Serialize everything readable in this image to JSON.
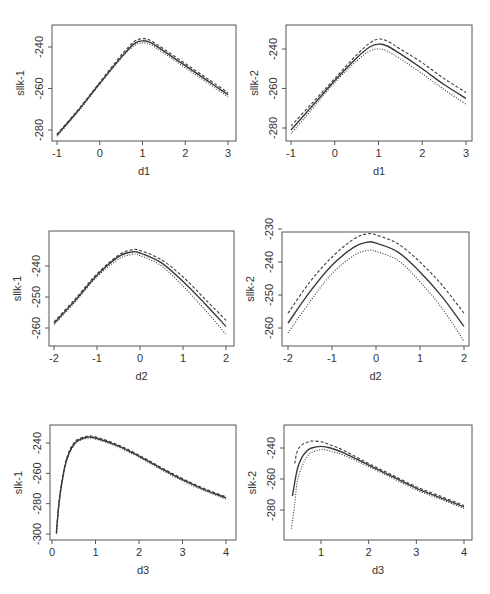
{
  "figure": {
    "layout": "3 rows x 2 columns of profile log-likelihood plots",
    "line_color": "#3a3a3a",
    "box_color": "#555555",
    "text_color": "#333333"
  },
  "chart_data": [
    {
      "id": "p1",
      "type": "line",
      "xlabel": "d1",
      "ylabel": "sllk-1",
      "xlim": [
        -1,
        3
      ],
      "ylim": [
        -284,
        -232
      ],
      "xticks": [
        -1,
        0,
        1,
        2,
        3
      ],
      "yticks": [
        -240,
        -260,
        -280
      ],
      "ytick_labels": [
        "-240",
        "-260",
        "-280"
      ],
      "box": {
        "x0": 52,
        "x1": 236,
        "y0": 25,
        "y1": 141
      },
      "px": {
        "x_at": [
          [
            -1,
            57
          ],
          [
            3,
            228
          ]
        ],
        "y_at": [
          [
            -240,
            47
          ],
          [
            -280,
            130
          ]
        ]
      },
      "series": [
        {
          "name": "upper",
          "style": "dashed",
          "x": [
            -1,
            -0.5,
            0,
            0.5,
            0.8,
            1.0,
            1.2,
            1.5,
            2,
            2.5,
            3
          ],
          "y": [
            -282,
            -270,
            -257,
            -244,
            -237.5,
            -236,
            -237,
            -241,
            -248,
            -255,
            -262
          ]
        },
        {
          "name": "estimate",
          "style": "solid",
          "x": [
            -1,
            -0.5,
            0,
            0.5,
            0.8,
            1.0,
            1.2,
            1.5,
            2,
            2.5,
            3
          ],
          "y": [
            -282.5,
            -270.5,
            -257.5,
            -245,
            -238.5,
            -237,
            -238,
            -242,
            -249,
            -256,
            -263
          ]
        },
        {
          "name": "lower",
          "style": "dotted",
          "x": [
            -1,
            -0.5,
            0,
            0.5,
            0.8,
            1.0,
            1.2,
            1.5,
            2,
            2.5,
            3
          ],
          "y": [
            -283,
            -271,
            -258,
            -245.5,
            -239.5,
            -238,
            -239,
            -243,
            -250,
            -257,
            -264
          ]
        }
      ]
    },
    {
      "id": "p2",
      "type": "line",
      "xlabel": "d1",
      "ylabel": "sllk-2",
      "xlim": [
        -1,
        3
      ],
      "ylim": [
        -284,
        -232
      ],
      "xticks": [
        -1,
        0,
        1,
        2,
        3
      ],
      "yticks": [
        -240,
        -260,
        -280
      ],
      "ytick_labels": [
        "-240",
        "-260",
        "-280"
      ],
      "box": {
        "x0": 286,
        "x1": 472,
        "y0": 25,
        "y1": 141
      },
      "px": {
        "x_at": [
          [
            -1,
            291
          ],
          [
            3,
            466
          ]
        ],
        "y_at": [
          [
            -240,
            49
          ],
          [
            -280,
            128
          ]
        ]
      },
      "series": [
        {
          "name": "upper",
          "style": "dashed",
          "x": [
            -1,
            -0.5,
            0,
            0.5,
            0.8,
            1.0,
            1.2,
            1.5,
            2,
            2.5,
            3
          ],
          "y": [
            -279,
            -267,
            -255,
            -243,
            -237,
            -235,
            -236,
            -240,
            -247,
            -255,
            -262
          ]
        },
        {
          "name": "estimate",
          "style": "solid",
          "x": [
            -1,
            -0.5,
            0,
            0.5,
            0.8,
            1.0,
            1.2,
            1.5,
            2,
            2.5,
            3
          ],
          "y": [
            -281,
            -268.5,
            -256,
            -244.5,
            -239,
            -237.5,
            -238.5,
            -242.5,
            -250,
            -258,
            -265
          ]
        },
        {
          "name": "lower",
          "style": "dotted",
          "x": [
            -1,
            -0.5,
            0,
            0.5,
            0.8,
            1.0,
            1.2,
            1.5,
            2,
            2.5,
            3
          ],
          "y": [
            -283,
            -270,
            -257,
            -246,
            -241,
            -240,
            -241,
            -245,
            -252.5,
            -260.5,
            -268
          ]
        }
      ]
    },
    {
      "id": "p3",
      "type": "line",
      "xlabel": "d2",
      "ylabel": "sllk-1",
      "xlim": [
        -2,
        2
      ],
      "ylim": [
        -261.5,
        -232
      ],
      "xticks": [
        -2,
        -1,
        0,
        1,
        2
      ],
      "yticks": [
        -240,
        -250,
        -260
      ],
      "ytick_labels": [
        "-240",
        "-250",
        "-260"
      ],
      "box": {
        "x0": 49,
        "x1": 234,
        "y0": 231,
        "y1": 346
      },
      "px": {
        "x_at": [
          [
            -2,
            54
          ],
          [
            2,
            226
          ]
        ],
        "y_at": [
          [
            -240,
            266
          ],
          [
            -260,
            328
          ]
        ]
      },
      "series": [
        {
          "name": "upper",
          "style": "dashed",
          "x": [
            -2,
            -1.5,
            -1,
            -0.5,
            -0.2,
            0,
            0.5,
            1,
            1.5,
            2
          ],
          "y": [
            -258,
            -250.5,
            -242.5,
            -236.5,
            -234.8,
            -235,
            -238,
            -243.5,
            -250.5,
            -257.5
          ]
        },
        {
          "name": "estimate",
          "style": "solid",
          "x": [
            -2,
            -1.5,
            -1,
            -0.5,
            -0.2,
            0,
            0.5,
            1,
            1.5,
            2
          ],
          "y": [
            -258.5,
            -251,
            -243,
            -237,
            -235.5,
            -235.8,
            -239,
            -245,
            -252,
            -259.5
          ]
        },
        {
          "name": "lower",
          "style": "dotted",
          "x": [
            -2,
            -1.5,
            -1,
            -0.5,
            -0.2,
            0,
            0.5,
            1,
            1.5,
            2
          ],
          "y": [
            -259,
            -251.5,
            -243.5,
            -237.8,
            -236.3,
            -236.6,
            -240,
            -246.5,
            -254,
            -262
          ]
        }
      ]
    },
    {
      "id": "p4",
      "type": "line",
      "xlabel": "d2",
      "ylabel": "sllk-2",
      "xlim": [
        -2,
        2
      ],
      "ylim": [
        -265,
        -229
      ],
      "xticks": [
        -2,
        -1,
        0,
        1,
        2
      ],
      "yticks": [
        -230,
        -240,
        -250,
        -260
      ],
      "ytick_labels": [
        "-230",
        "-240",
        "-250",
        "-260"
      ],
      "box": {
        "x0": 282,
        "x1": 469,
        "y0": 232,
        "y1": 346
      },
      "px": {
        "x_at": [
          [
            -2,
            288
          ],
          [
            2,
            464
          ]
        ],
        "y_at": [
          [
            -230,
            229
          ],
          [
            -260,
            328
          ]
        ]
      },
      "series": [
        {
          "name": "upper",
          "style": "dashed",
          "x": [
            -2,
            -1.5,
            -1,
            -0.5,
            -0.2,
            0,
            0.5,
            1,
            1.5,
            2
          ],
          "y": [
            -255.5,
            -246,
            -238.5,
            -233,
            -231.5,
            -231.8,
            -234.5,
            -240,
            -247,
            -255.5
          ]
        },
        {
          "name": "estimate",
          "style": "solid",
          "x": [
            -2,
            -1.5,
            -1,
            -0.5,
            -0.2,
            0,
            0.5,
            1,
            1.5,
            2
          ],
          "y": [
            -258.5,
            -249,
            -241,
            -235.5,
            -234,
            -234.3,
            -237,
            -243,
            -250.5,
            -259.5
          ]
        },
        {
          "name": "lower",
          "style": "dotted",
          "x": [
            -2,
            -1.5,
            -1,
            -0.5,
            -0.2,
            0,
            0.5,
            1,
            1.5,
            2
          ],
          "y": [
            -261.5,
            -252,
            -243.5,
            -238,
            -236.5,
            -236.8,
            -239.5,
            -246,
            -254,
            -264
          ]
        }
      ]
    },
    {
      "id": "p5",
      "type": "line",
      "xlabel": "d3",
      "ylabel": "slk-1",
      "xlim": [
        0,
        4
      ],
      "ylim": [
        -300,
        -233
      ],
      "xticks": [
        0,
        1,
        2,
        3,
        4
      ],
      "yticks": [
        -240,
        -260,
        -280,
        -300
      ],
      "ytick_labels": [
        "-240",
        "-260",
        "-280",
        "-300"
      ],
      "box": {
        "x0": 50,
        "x1": 236,
        "y0": 425,
        "y1": 540
      },
      "px": {
        "x_at": [
          [
            0,
            52
          ],
          [
            4,
            226
          ]
        ],
        "y_at": [
          [
            -240,
            443
          ],
          [
            -300,
            534
          ]
        ]
      },
      "series": [
        {
          "name": "upper",
          "style": "dashed",
          "x": [
            0.1,
            0.15,
            0.2,
            0.3,
            0.4,
            0.5,
            0.6,
            0.8,
            1.0,
            1.5,
            2,
            2.5,
            3,
            3.5,
            4
          ],
          "y": [
            -299,
            -282,
            -270,
            -254,
            -245,
            -240,
            -237.5,
            -235.5,
            -236,
            -241,
            -248,
            -256,
            -263.5,
            -270,
            -275.5
          ]
        },
        {
          "name": "estimate",
          "style": "solid",
          "x": [
            0.1,
            0.15,
            0.2,
            0.3,
            0.4,
            0.5,
            0.6,
            0.8,
            1.0,
            1.5,
            2,
            2.5,
            3,
            3.5,
            4
          ],
          "y": [
            -299.5,
            -283,
            -271,
            -255,
            -246,
            -241,
            -238.2,
            -236.2,
            -236.7,
            -241.7,
            -248.7,
            -256.7,
            -264.2,
            -270.7,
            -276.2
          ]
        },
        {
          "name": "lower",
          "style": "dotted",
          "x": [
            0.1,
            0.15,
            0.2,
            0.3,
            0.4,
            0.5,
            0.6,
            0.8,
            1.0,
            1.5,
            2,
            2.5,
            3,
            3.5,
            4
          ],
          "y": [
            -300,
            -284,
            -272,
            -256,
            -247,
            -242,
            -239,
            -237,
            -237.4,
            -242.4,
            -249.4,
            -257.4,
            -265,
            -271.4,
            -277
          ]
        }
      ]
    },
    {
      "id": "p6",
      "type": "line",
      "xlabel": "d3",
      "ylabel": "slk-2",
      "xlim": [
        0.3,
        4
      ],
      "ylim": [
        -293,
        -233
      ],
      "xticks": [
        1,
        2,
        3,
        4
      ],
      "yticks": [
        -240,
        -260,
        -280
      ],
      "ytick_labels": [
        "-240",
        "-260",
        "-280"
      ],
      "box": {
        "x0": 284,
        "x1": 472,
        "y0": 425,
        "y1": 540
      },
      "px": {
        "x_at": [
          [
            1,
            321
          ],
          [
            4,
            464
          ]
        ],
        "y_at": [
          [
            -240,
            448
          ],
          [
            -280,
            510
          ]
        ]
      },
      "series": [
        {
          "name": "upper",
          "style": "dashed",
          "x": [
            0.45,
            0.5,
            0.6,
            0.7,
            0.8,
            1.0,
            1.2,
            1.5,
            2,
            2.5,
            3,
            3.5,
            4
          ],
          "y": [
            -250,
            -242,
            -238,
            -236.5,
            -235.5,
            -236,
            -238,
            -242,
            -250,
            -257.5,
            -265,
            -271,
            -277
          ]
        },
        {
          "name": "estimate",
          "style": "solid",
          "x": [
            0.4,
            0.5,
            0.6,
            0.7,
            0.8,
            1.0,
            1.2,
            1.5,
            2,
            2.5,
            3,
            3.5,
            4
          ],
          "y": [
            -271,
            -254,
            -246,
            -242,
            -240,
            -239,
            -240,
            -243.5,
            -251,
            -258.5,
            -266,
            -272,
            -278
          ]
        },
        {
          "name": "lower",
          "style": "dotted",
          "x": [
            0.38,
            0.45,
            0.5,
            0.6,
            0.7,
            0.8,
            1.0,
            1.2,
            1.5,
            2,
            2.5,
            3,
            3.5,
            4
          ],
          "y": [
            -292,
            -276,
            -262,
            -252,
            -246,
            -243,
            -241,
            -242,
            -245,
            -252,
            -259.5,
            -267,
            -273,
            -279
          ]
        }
      ]
    }
  ]
}
